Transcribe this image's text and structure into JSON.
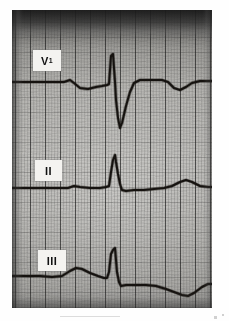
{
  "page": {
    "background_color": "#ffffff",
    "width": 229,
    "height": 321
  },
  "strip": {
    "kind": "ecg-strip-photograph",
    "paper_color": "#b2b1ad",
    "trace_color": "#15120f",
    "grid_major_color": "#141414",
    "grid_minor_color": "#373737",
    "grid_major_spacing_px": 15,
    "grid_minor_spacing_px": 3,
    "bounds": {
      "left": 12,
      "top": 10,
      "width": 200,
      "height": 298
    }
  },
  "leads": [
    {
      "id": "v1",
      "label": "V",
      "subscript": "1",
      "baseline_y": 72,
      "morphology": "small negative P-wave notch, tall narrow R spike, deep S wave, shallow inverted T-wave"
    },
    {
      "id": "ii",
      "label": "II",
      "subscript": "",
      "baseline_y": 177,
      "morphology": "flat baseline, tall narrow peaked R wave, low broad T-wave"
    },
    {
      "id": "iii",
      "label": "III",
      "subscript": "",
      "baseline_y": 266,
      "morphology": "broad positive P/hump, tall narrow R spike, descending ST, negative T-wave"
    }
  ],
  "chart_data": {
    "type": "line",
    "title": "",
    "xlabel": "",
    "ylabel": "",
    "grid": true,
    "legend_position": "inline-left",
    "series": [
      {
        "name": "V1",
        "baseline": 72,
        "points": "M0,72 L52,72 L58,70 L62,73 L68,78 L76,79 L84,77 L90,76 L95,75 L97,74 L99,46 L101,44 L103,72 L104,90 L106,108 L108,118 L110,113 L114,96 L118,82 L122,73 L128,70 L138,70 L150,70 L156,72 L162,78 L168,80 L174,77 L180,73 L188,71 L196,71 L200,71"
      },
      {
        "name": "II",
        "baseline": 177,
        "points": "M0,178 L40,178 L56,178 L62,176 L68,177 L78,178 L88,178 L94,177 L97,176 L99,162 L101,150 L103,145 L104,152 L106,164 L108,174 L110,180 L114,181 L122,180 L132,180 L142,179 L152,178 L160,176 L168,172 L174,170 L180,172 L188,176 L196,177 L200,177"
      },
      {
        "name": "III",
        "baseline": 266,
        "points": "M0,266 L28,266 L40,267 L50,266 L58,261 L64,258 L70,259 L78,263 L86,266 L92,268 L95,268 L97,262 L99,244 L101,240 L103,238 L105,262 L107,272 L109,276 L114,275 L124,275 L134,275 L144,276 L154,279 L162,282 L170,285 L176,286 L182,283 L190,277 L196,274 L200,274"
      }
    ]
  }
}
